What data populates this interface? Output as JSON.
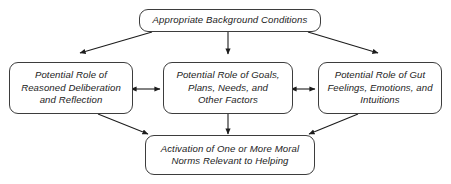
{
  "diagram": {
    "type": "flowchart",
    "title_text_style": "italic",
    "colors": {
      "background": "#ffffff",
      "box_border": "#3d3d3d",
      "box_fill": "#ffffff",
      "text": "#1c1c1c",
      "arrow": "#1c1c1c"
    },
    "nodes": [
      {
        "id": "top",
        "label": "Appropriate Background Conditions"
      },
      {
        "id": "left",
        "label": "Potential Role of\nReasoned Deliberation\nand Reflection"
      },
      {
        "id": "middle",
        "label": "Potential Role of Goals,\nPlans, Needs, and\nOther Factors"
      },
      {
        "id": "right",
        "label": "Potential Role of Gut\nFeelings, Emotions, and\nIntuitions"
      },
      {
        "id": "bottom",
        "label": "Activation of One or More Moral\nNorms Relevant to Helping"
      }
    ],
    "edges": [
      {
        "id": "top-to-left",
        "from": "top",
        "to": "left",
        "style": "single-arrow",
        "direction": "down-left"
      },
      {
        "id": "top-to-middle",
        "from": "top",
        "to": "middle",
        "style": "single-arrow",
        "direction": "down"
      },
      {
        "id": "top-to-right",
        "from": "top",
        "to": "right",
        "style": "single-arrow",
        "direction": "down-right"
      },
      {
        "id": "left-middle",
        "from": "left",
        "to": "middle",
        "style": "double-arrow",
        "direction": "horizontal"
      },
      {
        "id": "middle-right",
        "from": "middle",
        "to": "right",
        "style": "double-arrow",
        "direction": "horizontal"
      },
      {
        "id": "left-to-bottom",
        "from": "left",
        "to": "bottom",
        "style": "single-arrow",
        "direction": "down-right"
      },
      {
        "id": "middle-to-bottom",
        "from": "middle",
        "to": "bottom",
        "style": "single-arrow",
        "direction": "down"
      },
      {
        "id": "right-to-bottom",
        "from": "right",
        "to": "bottom",
        "style": "single-arrow",
        "direction": "down-left"
      }
    ]
  }
}
